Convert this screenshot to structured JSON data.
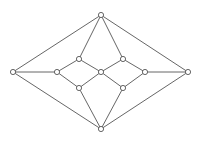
{
  "diagram": {
    "type": "graph",
    "nodes": [
      {
        "id": "top",
        "x": 101,
        "y": 15
      },
      {
        "id": "left",
        "x": 13,
        "y": 72
      },
      {
        "id": "right",
        "x": 188,
        "y": 72
      },
      {
        "id": "bottom",
        "x": 101,
        "y": 129
      },
      {
        "id": "inner-left",
        "x": 57,
        "y": 72
      },
      {
        "id": "upper-left",
        "x": 79,
        "y": 59
      },
      {
        "id": "lower-left",
        "x": 79,
        "y": 88
      },
      {
        "id": "center",
        "x": 101,
        "y": 72
      },
      {
        "id": "upper-right",
        "x": 123,
        "y": 59
      },
      {
        "id": "lower-right",
        "x": 123,
        "y": 88
      },
      {
        "id": "inner-right",
        "x": 145,
        "y": 72
      }
    ],
    "edges": [
      [
        "top",
        "left"
      ],
      [
        "top",
        "right"
      ],
      [
        "top",
        "upper-left"
      ],
      [
        "top",
        "upper-right"
      ],
      [
        "bottom",
        "left"
      ],
      [
        "bottom",
        "right"
      ],
      [
        "bottom",
        "lower-left"
      ],
      [
        "bottom",
        "lower-right"
      ],
      [
        "left",
        "inner-left"
      ],
      [
        "right",
        "inner-right"
      ],
      [
        "inner-left",
        "upper-left"
      ],
      [
        "inner-left",
        "lower-left"
      ],
      [
        "upper-left",
        "center"
      ],
      [
        "lower-left",
        "center"
      ],
      [
        "center",
        "upper-right"
      ],
      [
        "center",
        "lower-right"
      ],
      [
        "upper-right",
        "inner-right"
      ],
      [
        "lower-right",
        "inner-right"
      ]
    ],
    "colors": {
      "stroke": "#555555",
      "node_fill": "#ffffff",
      "background": "#ffffff"
    }
  }
}
